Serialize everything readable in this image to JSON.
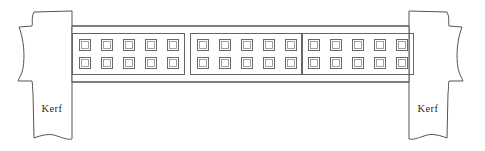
{
  "figure": {
    "type": "technical-line-drawing",
    "canvas": {
      "width": 485,
      "height": 151
    },
    "background_color": "#ffffff",
    "line_color": "#555555"
  },
  "labels": {
    "kerf_left": "Kerf",
    "kerf_right": "Kerf"
  },
  "beam": {
    "name": "blade-body",
    "top_y": 26,
    "bottom_y": 82,
    "left_x": 60,
    "right_x": 420,
    "fill": "#ffffff",
    "stroke": "#555555"
  },
  "kerf_blocks": [
    {
      "id": "kerf-left",
      "label": "Kerf",
      "label_x": 52,
      "label_y": 110,
      "stem_left_x": 33,
      "stem_right_x": 72,
      "top_y": 11,
      "bottom_y": 139,
      "edge_style": "wavy-torn"
    },
    {
      "id": "kerf-right",
      "label": "Kerf",
      "label_x": 428,
      "label_y": 110,
      "stem_left_x": 408,
      "stem_right_x": 448,
      "top_y": 11,
      "bottom_y": 139,
      "edge_style": "wavy-torn"
    }
  ],
  "tooth_panels": [
    {
      "id": "tooth-panel-1",
      "x": 72,
      "y": 33,
      "width": 113,
      "height": 42,
      "columns": 5,
      "rows": 2,
      "tooth_count": 10,
      "tooth_size": 11
    },
    {
      "id": "tooth-panel-2",
      "x": 190,
      "y": 33,
      "width": 113,
      "height": 42,
      "columns": 5,
      "rows": 2,
      "tooth_count": 10,
      "tooth_size": 11
    },
    {
      "id": "tooth-panel-3",
      "x": 301,
      "y": 33,
      "width": 113,
      "height": 42,
      "columns": 5,
      "rows": 2,
      "tooth_count": 10,
      "tooth_size": 11
    }
  ],
  "totals": {
    "panel_count": 3,
    "total_teeth": 30
  }
}
